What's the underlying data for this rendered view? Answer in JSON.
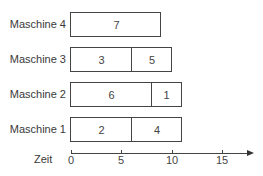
{
  "chart_data": {
    "type": "gantt",
    "title": "",
    "xlabel": "Zeit",
    "ylabel": "",
    "xlim": [
      0,
      18
    ],
    "xticks": [
      0,
      5,
      10,
      15
    ],
    "categories": [
      "Maschine 4",
      "Maschine 3",
      "Maschine 2",
      "Maschine 1"
    ],
    "rows": [
      {
        "machine": "Maschine 4",
        "tasks": [
          {
            "job": "7",
            "start": 0,
            "end": 9
          }
        ]
      },
      {
        "machine": "Maschine 3",
        "tasks": [
          {
            "job": "3",
            "start": 0,
            "end": 6
          },
          {
            "job": "5",
            "start": 6,
            "end": 10
          }
        ]
      },
      {
        "machine": "Maschine 2",
        "tasks": [
          {
            "job": "6",
            "start": 0,
            "end": 8
          },
          {
            "job": "1",
            "start": 8,
            "end": 11
          }
        ]
      },
      {
        "machine": "Maschine 1",
        "tasks": [
          {
            "job": "2",
            "start": 0,
            "end": 6
          },
          {
            "job": "4",
            "start": 6,
            "end": 11
          }
        ]
      }
    ],
    "grid": false,
    "legend": null
  },
  "axis": {
    "name": "Zeit",
    "ticks": [
      "0",
      "5",
      "10",
      "15"
    ]
  }
}
